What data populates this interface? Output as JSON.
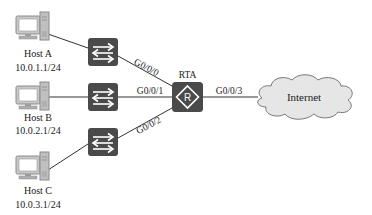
{
  "diagram": {
    "hosts": [
      {
        "name": "Host A",
        "ip": "10.0.1.1/24"
      },
      {
        "name": "Host B",
        "ip": "10.0.2.1/24"
      },
      {
        "name": "Host C",
        "ip": "10.0.3.1/24"
      }
    ],
    "router": {
      "name": "RTA",
      "symbol": "R"
    },
    "links": [
      {
        "from": "switch-a",
        "to": "router",
        "interface": "G0/0/0"
      },
      {
        "from": "switch-b",
        "to": "router",
        "interface": "G0/0/1"
      },
      {
        "from": "switch-c",
        "to": "router",
        "interface": "G0/0/2"
      },
      {
        "from": "router",
        "to": "internet",
        "interface": "G0/0/3"
      }
    ],
    "cloud": {
      "label": "Internet"
    },
    "colors": {
      "device": "#4a4a4a",
      "cloud_fill": "#e6e6e6",
      "line": "#333333",
      "pc": "#8a8a8a"
    }
  }
}
